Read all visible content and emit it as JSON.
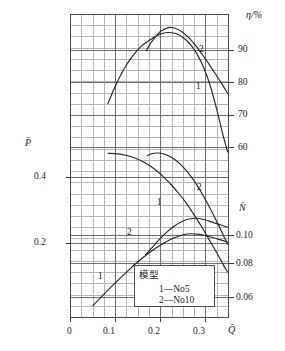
{
  "chart_data": {
    "type": "line",
    "title": "",
    "subtitle": "",
    "xlabel": "Q̄",
    "ylabel": "P̄",
    "ylabel_right_top": "η/%",
    "ylabel_right_bottom": "N̄",
    "grid": true,
    "legend_position": "inside-bottom-center",
    "xlim": [
      0.0,
      0.35
    ],
    "xticks": [
      0,
      0.1,
      0.2,
      0.3
    ],
    "xtick_labels": [
      "0",
      "0.1",
      "0.2",
      "0.3"
    ],
    "x_minor_step": 0.025,
    "left_axis": {
      "name": "P̄",
      "ticks": [
        0.2,
        0.4
      ],
      "tick_labels": [
        "0.2",
        "0.4"
      ],
      "lim": [
        0.06,
        0.52
      ]
    },
    "right_axis_efficiency": {
      "name": "η/%",
      "ticks": [
        60,
        70,
        80,
        90
      ],
      "tick_labels": [
        "60",
        "70",
        "80",
        "90"
      ],
      "lim": [
        40,
        102
      ]
    },
    "right_axis_power": {
      "name": "N̄",
      "ticks": [
        0.06,
        0.08,
        0.1
      ],
      "tick_labels": [
        "0.06",
        "0.08",
        "0.10"
      ],
      "lim": [
        0.05,
        0.125
      ]
    },
    "series": [
      {
        "name": "efficiency-no5",
        "label": "1",
        "axis": "efficiency",
        "points": [
          [
            0.083,
            73.5
          ],
          [
            0.1,
            79.0
          ],
          [
            0.12,
            84.5
          ],
          [
            0.14,
            88.6
          ],
          [
            0.16,
            91.6
          ],
          [
            0.175,
            93.0
          ],
          [
            0.19,
            94.3
          ],
          [
            0.205,
            95.2
          ],
          [
            0.22,
            95.4
          ],
          [
            0.235,
            95.0
          ],
          [
            0.25,
            93.8
          ],
          [
            0.265,
            91.8
          ],
          [
            0.28,
            88.8
          ],
          [
            0.295,
            84.6
          ],
          [
            0.31,
            78.8
          ],
          [
            0.325,
            71.0
          ],
          [
            0.34,
            62.5
          ],
          [
            0.348,
            58.5
          ]
        ]
      },
      {
        "name": "efficiency-no10",
        "label": "2",
        "axis": "efficiency",
        "points": [
          [
            0.168,
            89.8
          ],
          [
            0.178,
            92.2
          ],
          [
            0.19,
            94.4
          ],
          [
            0.2,
            95.8
          ],
          [
            0.212,
            96.7
          ],
          [
            0.222,
            97.0
          ],
          [
            0.235,
            96.6
          ],
          [
            0.248,
            95.5
          ],
          [
            0.262,
            93.8
          ],
          [
            0.276,
            91.6
          ],
          [
            0.29,
            89.0
          ],
          [
            0.305,
            86.0
          ],
          [
            0.32,
            82.8
          ],
          [
            0.335,
            79.6
          ],
          [
            0.348,
            76.6
          ]
        ]
      },
      {
        "name": "head-no5",
        "label": "1",
        "axis": "head",
        "points": [
          [
            0.083,
            0.472
          ],
          [
            0.105,
            0.47
          ],
          [
            0.125,
            0.465
          ],
          [
            0.145,
            0.456
          ],
          [
            0.165,
            0.443
          ],
          [
            0.185,
            0.425
          ],
          [
            0.205,
            0.402
          ],
          [
            0.222,
            0.378
          ],
          [
            0.24,
            0.35
          ],
          [
            0.258,
            0.318
          ],
          [
            0.275,
            0.283
          ],
          [
            0.292,
            0.246
          ],
          [
            0.308,
            0.208
          ],
          [
            0.325,
            0.168
          ],
          [
            0.34,
            0.13
          ],
          [
            0.348,
            0.112
          ]
        ]
      },
      {
        "name": "head-no10",
        "label": "2",
        "axis": "head",
        "points": [
          [
            0.17,
            0.465
          ],
          [
            0.185,
            0.472
          ],
          [
            0.2,
            0.472
          ],
          [
            0.215,
            0.466
          ],
          [
            0.23,
            0.454
          ],
          [
            0.245,
            0.437
          ],
          [
            0.26,
            0.414
          ],
          [
            0.275,
            0.386
          ],
          [
            0.29,
            0.353
          ],
          [
            0.305,
            0.316
          ],
          [
            0.32,
            0.276
          ],
          [
            0.335,
            0.234
          ],
          [
            0.348,
            0.196
          ]
        ]
      },
      {
        "name": "power-no5",
        "label": "1",
        "axis": "power",
        "points": [
          [
            0.05,
            0.0545
          ],
          [
            0.07,
            0.0606
          ],
          [
            0.09,
            0.0665
          ],
          [
            0.11,
            0.0722
          ],
          [
            0.13,
            0.0777
          ],
          [
            0.15,
            0.0829
          ],
          [
            0.17,
            0.0876
          ],
          [
            0.19,
            0.0918
          ],
          [
            0.21,
            0.0954
          ],
          [
            0.23,
            0.0982
          ],
          [
            0.248,
            0.1
          ],
          [
            0.265,
            0.1008
          ],
          [
            0.285,
            0.1004
          ],
          [
            0.305,
            0.0992
          ],
          [
            0.325,
            0.0975
          ],
          [
            0.348,
            0.0955
          ]
        ]
      },
      {
        "name": "power-no10",
        "label": "2",
        "axis": "power",
        "points": [
          [
            0.166,
            0.0872
          ],
          [
            0.182,
            0.0924
          ],
          [
            0.198,
            0.0975
          ],
          [
            0.214,
            0.102
          ],
          [
            0.23,
            0.1058
          ],
          [
            0.246,
            0.1086
          ],
          [
            0.262,
            0.1103
          ],
          [
            0.278,
            0.1108
          ],
          [
            0.295,
            0.11
          ],
          [
            0.312,
            0.1085
          ],
          [
            0.33,
            0.1068
          ],
          [
            0.348,
            0.105
          ]
        ]
      }
    ],
    "curve_labels": [
      {
        "text": "2",
        "series": "efficiency-no10",
        "x_px": 199,
        "y_px": 45
      },
      {
        "text": "1",
        "series": "efficiency-no5",
        "x_px": 196,
        "y_px": 82
      },
      {
        "text": "2",
        "series": "head-no10",
        "x_px": 197,
        "y_px": 183
      },
      {
        "text": "1",
        "series": "head-no5",
        "x_px": 157,
        "y_px": 198
      },
      {
        "text": "2",
        "series": "power-no10",
        "x_px": 127,
        "y_px": 228
      },
      {
        "text": "1",
        "series": "power-no5",
        "x_px": 98,
        "y_px": 272
      }
    ],
    "legend": {
      "title": "模型",
      "entries": [
        "1—No5",
        "2—No10"
      ]
    },
    "colors": {
      "curve": "#262626",
      "grid_major": "#6e6e6e",
      "grid_minor": "#b5b5b5",
      "axis": "#3a3a3a",
      "text": "#1a1a1a",
      "background": "#ffffff"
    }
  }
}
